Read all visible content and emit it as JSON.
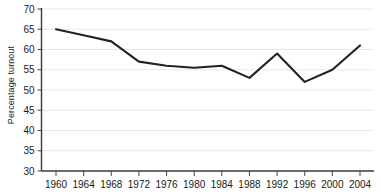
{
  "chart_data": {
    "type": "line",
    "title": "",
    "subtitle": "",
    "xlabel": "",
    "ylabel": "Percentage turnout",
    "x": [
      1960,
      1964,
      1968,
      1972,
      1976,
      1980,
      1984,
      1988,
      1992,
      1996,
      2000,
      2004
    ],
    "values": [
      65.0,
      63.5,
      62.0,
      57.0,
      56.0,
      55.5,
      56.0,
      53.0,
      59.0,
      52.0,
      55.0,
      61.0
    ],
    "series": [
      {
        "name": "Percentage turnout",
        "values": [
          65.0,
          63.5,
          62.0,
          57.0,
          56.0,
          55.5,
          56.0,
          53.0,
          59.0,
          52.0,
          55.0,
          61.0
        ]
      }
    ],
    "xticks": [
      "1960",
      "1964",
      "1968",
      "1972",
      "1976",
      "1980",
      "1984",
      "1988",
      "1992",
      "1996",
      "2000",
      "2004"
    ],
    "yticks": [
      "30",
      "35",
      "40",
      "45",
      "50",
      "55",
      "60",
      "65",
      "70"
    ],
    "ylim": [
      30,
      70
    ],
    "xlim": [
      1960,
      2004
    ],
    "grid": true,
    "legend": "none",
    "line_color": "#222222",
    "grid_color": "#e8e8e8",
    "axis_color": "#555555",
    "background_color": "#ffffff"
  }
}
